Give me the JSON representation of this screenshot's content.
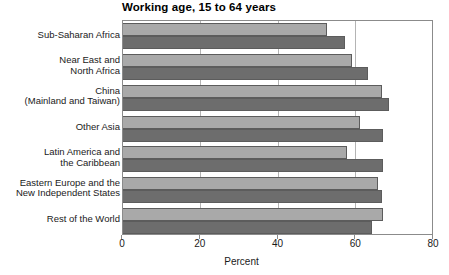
{
  "chart_data": {
    "type": "bar",
    "orientation": "horizontal",
    "title": "Working age, 15 to 64 years",
    "xlabel": "Percent",
    "ylabel": "",
    "xlim": [
      0,
      80
    ],
    "xticks": [
      0,
      20,
      40,
      60,
      80
    ],
    "xtick_labels": [
      "0",
      "20",
      "40",
      "60",
      "80"
    ],
    "grid": true,
    "grid_axis": "x",
    "legend": null,
    "categories": [
      "Sub-Saharan Africa",
      "Near East and North Africa",
      "China (Mainland and Taiwan)",
      "Other Asia",
      "Latin America and the Caribbean",
      "Eastern Europe and the New Independent States",
      "Rest of the World"
    ],
    "category_lines": [
      [
        "Sub-Saharan Africa"
      ],
      [
        "Near East and",
        "North Africa"
      ],
      [
        "China",
        "(Mainland and Taiwan)"
      ],
      [
        "Other Asia"
      ],
      [
        "Latin America and",
        "the Caribbean"
      ],
      [
        "Eastern Europe and the",
        "New Independent States"
      ],
      [
        "Rest of the World"
      ]
    ],
    "series": [
      {
        "name": "series-light",
        "color": "#a9a9a9",
        "values": [
          52.5,
          59.0,
          66.5,
          61.0,
          57.5,
          65.5,
          67.0
        ]
      },
      {
        "name": "series-dark",
        "color": "#6d6d6d",
        "values": [
          57.0,
          63.0,
          68.5,
          67.0,
          67.0,
          66.5,
          64.0
        ]
      }
    ]
  },
  "colors": {
    "light_bar": "#a9a9a9",
    "dark_bar": "#6d6d6d",
    "bar_edge": "#5c5c5c",
    "frame": "#8b8b8b",
    "gridline": "#b4b4b4",
    "text": "#1a1a1a",
    "background": "#ffffff"
  }
}
